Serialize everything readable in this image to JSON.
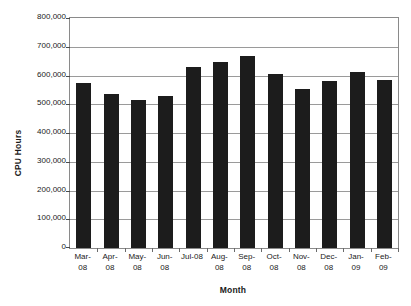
{
  "chart_data": {
    "type": "bar",
    "title": "",
    "xlabel": "Month",
    "ylabel": "CPU Hours",
    "categories": [
      "Mar-\n08",
      "Apr-\n08",
      "May-\n08",
      "Jun-\n08",
      "Jul-08",
      "Aug-\n08",
      "Sep-\n08",
      "Oct-\n08",
      "Nov-\n08",
      "Dec-\n08",
      "Jan-\n09",
      "Feb-\n09"
    ],
    "values": [
      574000,
      536000,
      515000,
      530000,
      630000,
      647000,
      668000,
      605000,
      553000,
      581000,
      612000,
      584000
    ],
    "ylim": [
      0,
      800000
    ],
    "ytick_values": [
      0,
      100000,
      200000,
      300000,
      400000,
      500000,
      600000,
      700000,
      800000
    ],
    "ytick_labels": [
      "0",
      "100,000",
      "200,000",
      "300,000",
      "400,000",
      "500,000",
      "600,000",
      "700,000",
      "800,000"
    ],
    "grid": true,
    "legend": false,
    "bar_color": "#1c1c1c",
    "gridline_color": "#9a9a9a",
    "background_color": "#ffffff"
  }
}
